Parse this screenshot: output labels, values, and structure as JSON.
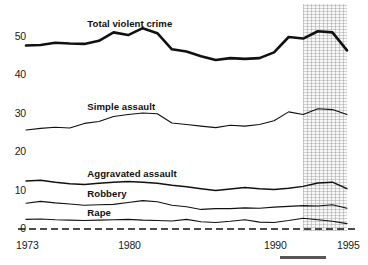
{
  "chart_data": {
    "type": "line",
    "title": "",
    "subtitle": "",
    "xlabel": "",
    "ylabel": "",
    "xlim": [
      1973,
      1995
    ],
    "ylim": [
      0,
      55
    ],
    "grid": false,
    "legend_position": "inline-annotations",
    "xticks": [
      1973,
      1980,
      1990,
      1995
    ],
    "yticks": [
      0,
      10,
      20,
      30,
      40,
      50
    ],
    "x": [
      1973,
      1974,
      1975,
      1976,
      1977,
      1978,
      1979,
      1980,
      1981,
      1982,
      1983,
      1984,
      1985,
      1986,
      1987,
      1988,
      1989,
      1990,
      1991,
      1992,
      1993,
      1994,
      1995
    ],
    "annotations": [
      {
        "text": "Total violent crime",
        "x": 1977.2,
        "y": 53.5
      },
      {
        "text": "Simple assault",
        "x": 1977.2,
        "y": 31.8
      },
      {
        "text": "Aggravated assault",
        "x": 1977.2,
        "y": 14.4
      },
      {
        "text": "Robbery",
        "x": 1977.2,
        "y": 9.0
      },
      {
        "text": "Rape",
        "x": 1977.2,
        "y": 4.1
      }
    ],
    "shaded_band": {
      "label": "",
      "x_start": 1992.0,
      "x_end": 1995.0
    },
    "baseline": {
      "value": 0,
      "style": "dashed"
    },
    "series": [
      {
        "name": "Total violent crime",
        "emphasis": "heavy",
        "values": [
          47.8,
          47.9,
          48.5,
          48.3,
          48.2,
          49.0,
          51.2,
          50.5,
          52.3,
          51.0,
          46.8,
          46.2,
          45.0,
          44.0,
          44.5,
          44.3,
          44.5,
          46.0,
          50.0,
          49.6,
          51.5,
          51.2,
          46.5
        ]
      },
      {
        "name": "Simple assault",
        "emphasis": "light",
        "values": [
          25.8,
          26.2,
          26.5,
          26.3,
          27.5,
          28.0,
          29.3,
          29.8,
          30.2,
          30.0,
          27.6,
          27.2,
          26.8,
          26.4,
          27.0,
          26.8,
          27.2,
          28.2,
          30.5,
          29.8,
          31.3,
          31.1,
          29.8
        ]
      },
      {
        "name": "Aggravated assault",
        "emphasis": "medium",
        "values": [
          12.5,
          12.7,
          12.2,
          11.8,
          11.6,
          11.9,
          12.2,
          12.4,
          12.2,
          11.9,
          11.4,
          11.0,
          10.5,
          10.0,
          10.4,
          10.8,
          10.5,
          10.3,
          10.6,
          11.1,
          12.0,
          12.2,
          10.5
        ]
      },
      {
        "name": "Robbery",
        "emphasis": "light",
        "values": [
          6.7,
          7.2,
          6.8,
          6.5,
          6.2,
          6.3,
          6.4,
          6.9,
          7.4,
          7.1,
          6.2,
          5.8,
          5.1,
          5.3,
          5.3,
          5.5,
          5.4,
          5.7,
          5.9,
          6.1,
          6.0,
          6.3,
          5.4
        ]
      },
      {
        "name": "Rape",
        "emphasis": "light",
        "values": [
          2.5,
          2.6,
          2.4,
          2.3,
          2.2,
          2.3,
          2.4,
          2.5,
          2.3,
          2.2,
          2.1,
          2.5,
          1.9,
          1.7,
          2.0,
          2.4,
          1.8,
          1.7,
          2.2,
          2.8,
          2.4,
          2.0,
          1.4
        ]
      }
    ],
    "colors": {
      "line": "#111111",
      "axis_text": "#1a1a1a",
      "band": "#dcdcdc",
      "background": "#ffffff"
    }
  }
}
